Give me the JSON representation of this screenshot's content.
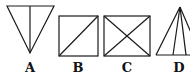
{
  "figures": [
    {
      "id": "A",
      "label": "A",
      "description": "inverted triangle with vertical median line"
    },
    {
      "id": "B",
      "label": "B",
      "description": "square with one diagonal"
    },
    {
      "id": "C",
      "label": "C",
      "description": "rectangle with both diagonals"
    },
    {
      "id": "D",
      "label": "D",
      "description": "triangle with lines from apex to base"
    }
  ],
  "colors": {
    "stroke": "#1a1a1a",
    "background": "#ffffff"
  }
}
